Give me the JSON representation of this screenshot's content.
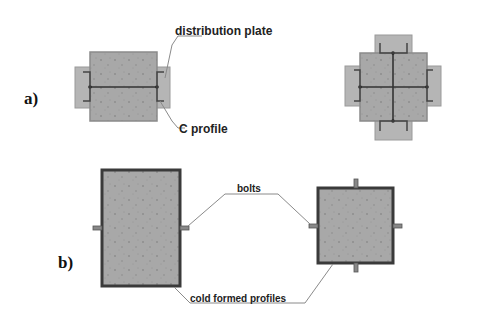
{
  "figure": {
    "parts": [
      {
        "id": "a",
        "label": "a)"
      },
      {
        "id": "b",
        "label": "b)"
      }
    ],
    "annotations": {
      "distribution_plate": "distribution plate",
      "c_profile": "C profile",
      "bolts": "bolts",
      "cold_formed_profiles": "cold formed profiles"
    },
    "colors": {
      "fill": "#a9a9a9",
      "plate": "#b8b8b8",
      "outline": "#444444",
      "leader": "#8a8a8a",
      "background": "#ffffff"
    }
  }
}
